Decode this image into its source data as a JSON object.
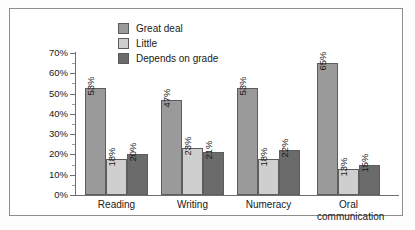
{
  "chart_data": {
    "type": "bar",
    "title": "",
    "subtitle": "",
    "xlabel": "",
    "ylabel": "",
    "ylim": [
      0,
      70
    ],
    "ytick_labels": [
      "0%",
      "10%",
      "20%",
      "30%",
      "40%",
      "50%",
      "60%",
      "70%"
    ],
    "ytick_values": [
      0,
      10,
      20,
      30,
      40,
      50,
      60,
      70
    ],
    "grid": false,
    "legend_position": "top-center",
    "categories": [
      "Reading",
      "Writing",
      "Numeracy",
      "Oral communication"
    ],
    "category_lines": [
      [
        "Reading"
      ],
      [
        "Writing"
      ],
      [
        "Numeracy"
      ],
      [
        "Oral",
        "communication"
      ]
    ],
    "series": [
      {
        "name": "Great deal",
        "color": "#9a9a9a",
        "values": [
          53,
          47,
          53,
          65
        ],
        "labels": [
          "53%",
          "47%",
          "53%",
          "65%"
        ]
      },
      {
        "name": "Little",
        "color": "#cfcfcf",
        "values": [
          18,
          23,
          18,
          13
        ],
        "labels": [
          "18%",
          "23%",
          "18%",
          "13%"
        ]
      },
      {
        "name": "Depends on grade",
        "color": "#6b6b6b",
        "values": [
          20,
          21,
          22,
          15
        ],
        "labels": [
          "20%",
          "21%",
          "22%",
          "15%"
        ]
      }
    ]
  },
  "colors": {
    "great_deal": "#9a9a9a",
    "little": "#cfcfcf",
    "depends_on_grade": "#6b6b6b",
    "axis": "#6f6f6f",
    "frame": "#8d8d8d",
    "bar_outline": "#5d5d5d",
    "background": "#ffffff",
    "text": "#202020"
  }
}
